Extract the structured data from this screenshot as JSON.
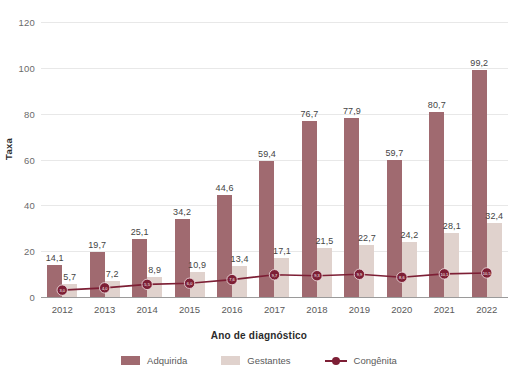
{
  "chart_data": {
    "type": "bar",
    "title": "",
    "subtitle": "",
    "xlabel": "Ano de diagnóstico",
    "ylabel": "Taxa",
    "ylim": [
      0,
      120
    ],
    "yticks": [
      0,
      20,
      40,
      60,
      80,
      100,
      120
    ],
    "ytick_labels": [
      "0",
      "20",
      "40",
      "60",
      "80",
      "100",
      "120"
    ],
    "grid": true,
    "legend_position": "bottom",
    "categories": [
      "2012",
      "2013",
      "2014",
      "2015",
      "2016",
      "2017",
      "2018",
      "2019",
      "2020",
      "2021",
      "2022"
    ],
    "series": [
      {
        "name": "Adquirida",
        "type": "bar",
        "color": "#a06a70",
        "values": [
          14.1,
          19.7,
          25.1,
          34.2,
          44.6,
          59.4,
          76.7,
          77.9,
          59.7,
          80.7,
          99.2
        ],
        "labels": [
          "14,1",
          "19,7",
          "25,1",
          "34,2",
          "44,6",
          "59,4",
          "76,7",
          "77,9",
          "59,7",
          "80,7",
          "99,2"
        ]
      },
      {
        "name": "Gestantes",
        "type": "bar",
        "color": "#e0d2cd",
        "values": [
          5.7,
          7.2,
          8.9,
          10.9,
          13.4,
          17.1,
          21.5,
          22.7,
          24.2,
          28.1,
          32.4
        ],
        "labels": [
          "5,7",
          "7,2",
          "8,9",
          "10,9",
          "13,4",
          "17,1",
          "21,5",
          "22,7",
          "24,2",
          "28,1",
          "32,4"
        ]
      },
      {
        "name": "Congênita",
        "type": "line",
        "color": "#7d1f35",
        "values": [
          3.0,
          4.0,
          5.5,
          6.0,
          7.6,
          9.7,
          9.3,
          9.9,
          8.6,
          10.1,
          10.5
        ],
        "labels": [
          "3,0",
          "4,0",
          "5,5",
          "6,0",
          "7,6",
          "9,7",
          "9,3",
          "9,9",
          "8,6",
          "10,1",
          "10,5"
        ]
      }
    ]
  },
  "legend": {
    "items": [
      {
        "label": "Adquirida",
        "marker": "square-swatch"
      },
      {
        "label": "Gestantes",
        "marker": "square-swatch"
      },
      {
        "label": "Congênita",
        "marker": "line-with-circle-marker"
      }
    ]
  },
  "colors": {
    "adquirida": "#a06a70",
    "gestantes": "#e0d2cd",
    "congenita": "#7d1f35",
    "gridline": "#e8e8e8",
    "axis": "#9a9a9a",
    "text": "#5a5a5a"
  }
}
